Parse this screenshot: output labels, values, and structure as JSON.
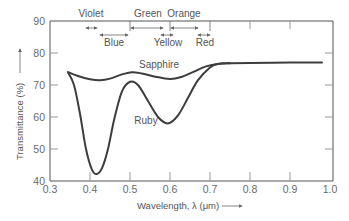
{
  "chart_data": {
    "type": "line",
    "title": "",
    "xlabel": "Wavelength, λ (μm)",
    "ylabel": "Transmittance (%)",
    "xlim": [
      0.3,
      1.0
    ],
    "ylim": [
      40,
      90
    ],
    "x_ticks": [
      "0.3",
      "0.4",
      "0.5",
      "0.6",
      "0.7",
      "0.8",
      "0.9",
      "1.0"
    ],
    "y_ticks": [
      "40",
      "50",
      "60",
      "70",
      "80",
      "90"
    ],
    "grid": false,
    "legend": "inline labels",
    "series": [
      {
        "name": "Sapphire",
        "x": [
          0.345,
          0.37,
          0.4,
          0.425,
          0.45,
          0.48,
          0.505,
          0.53,
          0.56,
          0.6,
          0.63,
          0.66,
          0.69,
          0.72,
          0.75,
          0.8,
          0.9,
          0.98
        ],
        "y": [
          74,
          72.8,
          71.8,
          71.5,
          72,
          73.3,
          74,
          73.6,
          72.7,
          71.9,
          72.6,
          74.2,
          75.8,
          76.6,
          76.8,
          76.9,
          77,
          77
        ]
      },
      {
        "name": "Ruby",
        "x": [
          0.345,
          0.36,
          0.375,
          0.39,
          0.405,
          0.417,
          0.43,
          0.445,
          0.46,
          0.48,
          0.5,
          0.52,
          0.545,
          0.57,
          0.595,
          0.62,
          0.645,
          0.67,
          0.7,
          0.72,
          0.75
        ],
        "y": [
          74,
          70,
          61,
          50,
          43.5,
          42.2,
          44,
          50,
          59,
          68,
          71,
          70,
          65,
          60,
          58,
          60.5,
          66,
          71.5,
          75.5,
          76.6,
          76.8
        ]
      }
    ],
    "annotations": [
      {
        "text": "Sapphire",
        "x": 0.52,
        "y": 75.5
      },
      {
        "text": "Ruby",
        "x": 0.475,
        "y": 61
      }
    ],
    "color_bands": [
      {
        "name": "Violet",
        "range": [
          0.4,
          0.42
        ]
      },
      {
        "name": "Blue",
        "range": [
          0.43,
          0.495
        ]
      },
      {
        "name": "Green",
        "range": [
          0.5,
          0.58
        ]
      },
      {
        "name": "Yellow",
        "range": [
          0.58,
          0.6
        ]
      },
      {
        "name": "Orange",
        "range": [
          0.6,
          0.67
        ]
      },
      {
        "name": "Red",
        "range": [
          0.67,
          0.7
        ]
      }
    ]
  },
  "labels": {
    "xlabel": "Wavelength, λ (μm)",
    "ylabel": "Transmittance (%)",
    "sapphire": "Sapphire",
    "ruby": "Ruby",
    "bands": {
      "violet": "Violet",
      "blue": "Blue",
      "green": "Green",
      "yellow": "Yellow",
      "orange": "Orange",
      "red": "Red"
    },
    "x_ticks": [
      "0.3",
      "0.4",
      "0.5",
      "0.6",
      "0.7",
      "0.8",
      "0.9",
      "1.0"
    ],
    "y_ticks": [
      "40",
      "50",
      "60",
      "70",
      "80",
      "90"
    ]
  },
  "colors": {
    "curve": "#3d3d3d",
    "frame": "#555555",
    "text": "#555555"
  }
}
